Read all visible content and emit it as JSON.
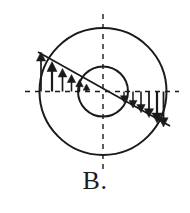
{
  "figure": {
    "label": "B.",
    "label_x": 103,
    "label_y": 188,
    "label_font_size": 26,
    "background_color": "#ffffff",
    "ink_color": "#1a1a1a"
  },
  "geometry": {
    "center": {
      "x": 103,
      "y": 91.5
    },
    "outer_circle": {
      "cx": 103,
      "cy": 91.5,
      "r": 63.5,
      "stroke_width": 2.0
    },
    "inner_circle": {
      "cx": 103,
      "cy": 91.5,
      "r": 25.0,
      "stroke_width": 2.0
    },
    "vertical_center_line": {
      "x": 103,
      "y1": 14,
      "y2": 169,
      "dash": "5,5",
      "stroke_width": 1.4
    },
    "horizontal_center_line": {
      "y": 91.5,
      "x1": 25,
      "x2": 179,
      "dash": "5,5",
      "stroke_width": 1.4
    },
    "distribution_line": {
      "x1": 38,
      "y1": 52,
      "x2": 170,
      "y2": 126,
      "stroke_width": 1.8
    }
  },
  "chart_data": {
    "type": "line",
    "title": "B.",
    "xlabel": "",
    "ylabel": "shear stress",
    "grid": false,
    "legend": null,
    "annotations": [
      "Upward arrows on the left half: magnitude decreases from the outer radius toward the center",
      "Downward arrows on the right half: magnitude increases from the center toward the outer radius",
      "Stress varies linearly with radius along the inclined diameter"
    ],
    "series": [
      {
        "name": "left-half-arrows-up",
        "direction": "up",
        "x": [
          41,
          52,
          63,
          72,
          80,
          87
        ],
        "values": [
          39,
          29,
          22,
          16,
          11,
          7
        ]
      },
      {
        "name": "right-half-arrows-down",
        "direction": "down",
        "x": [
          124,
          133,
          141,
          149,
          157,
          163
        ],
        "values": [
          10,
          16,
          21,
          26,
          32,
          37
        ]
      }
    ]
  },
  "arrows": {
    "left": [
      {
        "x": 41.0,
        "tip_y": 52.0,
        "base_y": 91.5,
        "head_w": 4.6,
        "head_h": 9.0,
        "shaft_w": 1.7
      },
      {
        "x": 52.0,
        "tip_y": 61.5,
        "base_y": 91.5,
        "head_w": 5.0,
        "head_h": 10.0,
        "shaft_w": 2.2
      },
      {
        "x": 62.5,
        "tip_y": 68.5,
        "base_y": 91.5,
        "head_w": 4.4,
        "head_h": 8.5,
        "shaft_w": 1.7
      },
      {
        "x": 71.5,
        "tip_y": 74.5,
        "base_y": 91.5,
        "head_w": 4.2,
        "head_h": 8.0,
        "shaft_w": 1.6
      },
      {
        "x": 79.5,
        "tip_y": 79.5,
        "base_y": 91.5,
        "head_w": 3.8,
        "head_h": 7.2,
        "shaft_w": 1.5
      },
      {
        "x": 86.5,
        "tip_y": 84.0,
        "base_y": 91.5,
        "head_w": 3.4,
        "head_h": 6.2,
        "shaft_w": 1.4
      }
    ],
    "right": [
      {
        "x": 124.0,
        "tip_y": 102.5,
        "base_y": 91.5,
        "head_w": 3.6,
        "head_h": 6.8,
        "shaft_w": 1.4
      },
      {
        "x": 133.0,
        "tip_y": 108.0,
        "base_y": 91.5,
        "head_w": 4.0,
        "head_h": 7.6,
        "shaft_w": 1.5
      },
      {
        "x": 141.0,
        "tip_y": 112.8,
        "base_y": 91.5,
        "head_w": 4.2,
        "head_h": 8.2,
        "shaft_w": 1.6
      },
      {
        "x": 149.0,
        "tip_y": 117.5,
        "base_y": 91.5,
        "head_w": 4.6,
        "head_h": 8.8,
        "shaft_w": 1.8
      },
      {
        "x": 157.0,
        "tip_y": 123.0,
        "base_y": 91.5,
        "head_w": 5.0,
        "head_h": 10.0,
        "shaft_w": 2.2
      },
      {
        "x": 163.5,
        "tip_y": 127.0,
        "base_y": 91.5,
        "head_w": 4.6,
        "head_h": 9.2,
        "shaft_w": 1.8
      }
    ]
  }
}
